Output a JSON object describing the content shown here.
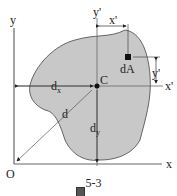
{
  "figure": {
    "caption_prefix": "图",
    "caption_number": "5-3",
    "axes": {
      "x_label": "x",
      "y_label": "y",
      "origin_label": "O",
      "x_prime_label": "x'",
      "y_prime_label": "y'"
    },
    "centroid_label": "C",
    "element_label": "dA",
    "distances": {
      "x_prime": "x'",
      "y_prime": "y'",
      "d": "d",
      "dx_main": "d",
      "dx_sub": "x",
      "dy_main": "d",
      "dy_sub": "y"
    },
    "colors": {
      "area_fill": "#c8c8c8",
      "stroke": "#333333"
    }
  }
}
